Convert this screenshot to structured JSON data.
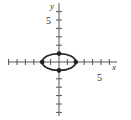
{
  "chart_data": {
    "type": "line",
    "title": "",
    "xlabel": "x",
    "ylabel": "y",
    "x_tick_label": "5",
    "y_tick_label": "5",
    "xlim": [
      -6,
      7
    ],
    "ylim": [
      -6.5,
      7
    ],
    "grid": false,
    "curve": {
      "kind": "ellipse",
      "equation": "x^2/4 + y^2 = 1",
      "center": [
        0,
        0
      ],
      "semi_axis_x": 2,
      "semi_axis_y": 1
    },
    "points": [
      {
        "x": -2,
        "y": 0
      },
      {
        "x": 2,
        "y": 0
      },
      {
        "x": 0,
        "y": 1
      },
      {
        "x": 0,
        "y": -1
      }
    ]
  },
  "colors": {
    "axis": "#555555",
    "curve": "#222222"
  }
}
